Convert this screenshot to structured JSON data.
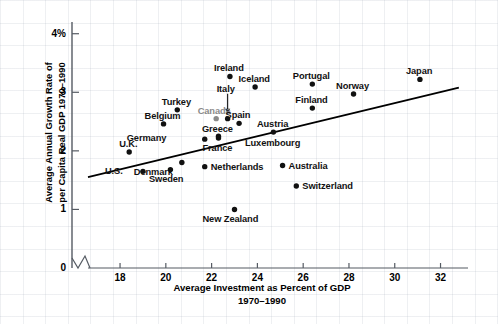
{
  "chart_data": {
    "type": "scatter",
    "title": "",
    "xlabel": "Average Investment as Percent of GDP 1970–1990",
    "xlabel_line1": "Average Investment as Percent of GDP",
    "xlabel_line2": "1970–1990",
    "ylabel": "Average Annual Growth Rate of per Capita Real GDP 1970–1990",
    "ylabel_line1": "Average Annual Growth Rate of",
    "ylabel_line2": "per Capita Real GDP 1970–1990",
    "xlim": [
      16.6,
      33.2
    ],
    "ylim": [
      0,
      4.2
    ],
    "xticks": [
      "18",
      "20",
      "22",
      "24",
      "26",
      "28",
      "30",
      "32"
    ],
    "xtick_values": [
      18,
      20,
      22,
      24,
      26,
      28,
      30,
      32
    ],
    "yticks": [
      "0",
      "1",
      "2",
      "3",
      "4%"
    ],
    "ytick_values": [
      0,
      1,
      2,
      3,
      4
    ],
    "grid": true,
    "axis_break": true,
    "legend_position": "none",
    "point_color": "#111111",
    "trendline": {
      "x0": 16.6,
      "y0": 1.55,
      "x1": 32.8,
      "y1": 3.08,
      "color": "#000000"
    },
    "points": [
      {
        "label": "Japan",
        "x": 31.1,
        "y": 3.22,
        "label_dx": -1,
        "label_dy": -13,
        "color": "#111111"
      },
      {
        "label": "Ireland",
        "x": 22.8,
        "y": 3.27,
        "label_dx": -1,
        "label_dy": -13,
        "color": "#111111"
      },
      {
        "label": "Portugal",
        "x": 26.4,
        "y": 3.14,
        "label_dx": -1,
        "label_dy": -13,
        "color": "#111111"
      },
      {
        "label": "Norway",
        "x": 28.2,
        "y": 2.97,
        "label_dx": -1,
        "label_dy": -13,
        "color": "#111111"
      },
      {
        "label": "Iceland",
        "x": 23.9,
        "y": 3.09,
        "label_dx": -1,
        "label_dy": -13,
        "color": "#111111"
      },
      {
        "label": "Italy",
        "x": 22.7,
        "y": 2.55,
        "label_dx": -2,
        "label_dy": -35,
        "color": "#111111",
        "leader": true
      },
      {
        "label": "Finland",
        "x": 26.4,
        "y": 2.73,
        "label_dx": -1,
        "label_dy": -13,
        "color": "#111111"
      },
      {
        "label": "Turkey",
        "x": 20.5,
        "y": 2.7,
        "label_dx": -1,
        "label_dy": -13,
        "color": "#111111"
      },
      {
        "label": "Canada",
        "x": 22.2,
        "y": 2.55,
        "label_dx": -2,
        "label_dy": -13,
        "color": "#8a8a8a"
      },
      {
        "label": "Spain",
        "x": 23.2,
        "y": 2.47,
        "label_dx": -1,
        "label_dy": -13,
        "color": "#111111"
      },
      {
        "label": "Belgium",
        "x": 19.9,
        "y": 2.46,
        "label_dx": -1,
        "label_dy": -13,
        "color": "#111111"
      },
      {
        "label": "Austria",
        "x": 24.7,
        "y": 2.32,
        "label_dx": -1,
        "label_dy": -13,
        "color": "#111111"
      },
      {
        "label": "Greece",
        "x": 22.3,
        "y": 2.25,
        "label_dx": -1,
        "label_dy": -12,
        "color": "#111111"
      },
      {
        "label": "Luxembourg",
        "x": 24.7,
        "y": 2.32,
        "label_dx": -1,
        "label_dy": 6,
        "color": "#111111",
        "no_marker": true
      },
      {
        "label": "Germany",
        "x": 21.7,
        "y": 2.2,
        "label_dx": -48,
        "label_dy": -6,
        "color": "#111111"
      },
      {
        "label": "France",
        "x": 22.3,
        "y": 2.22,
        "label_dx": -1,
        "label_dy": 5,
        "color": "#111111"
      },
      {
        "label": "U.K.",
        "x": 18.4,
        "y": 1.98,
        "label_dx": -1,
        "label_dy": -13,
        "color": "#111111"
      },
      {
        "label": "Denmark",
        "x": 20.7,
        "y": 1.8,
        "label_dx": -19,
        "label_dy": 4,
        "color": "#111111"
      },
      {
        "label": "Netherlands",
        "x": 21.7,
        "y": 1.73,
        "label_dx": 6,
        "label_dy": -5,
        "color": "#111111"
      },
      {
        "label": "U.S.",
        "x": 19.0,
        "y": 1.65,
        "label_dx": -30,
        "label_dy": -5,
        "color": "#111111"
      },
      {
        "label": "Sweden",
        "x": 20.2,
        "y": 1.68,
        "label_dx": -4,
        "label_dy": 4,
        "color": "#111111"
      },
      {
        "label": "Australia",
        "x": 25.1,
        "y": 1.75,
        "label_dx": 6,
        "label_dy": -5,
        "color": "#111111"
      },
      {
        "label": "Switzerland",
        "x": 25.7,
        "y": 1.4,
        "label_dx": 6,
        "label_dy": -5,
        "color": "#111111"
      },
      {
        "label": "New Zealand",
        "x": 23.0,
        "y": 1.0,
        "label_dx": -4,
        "label_dy": 5,
        "color": "#111111"
      }
    ]
  }
}
